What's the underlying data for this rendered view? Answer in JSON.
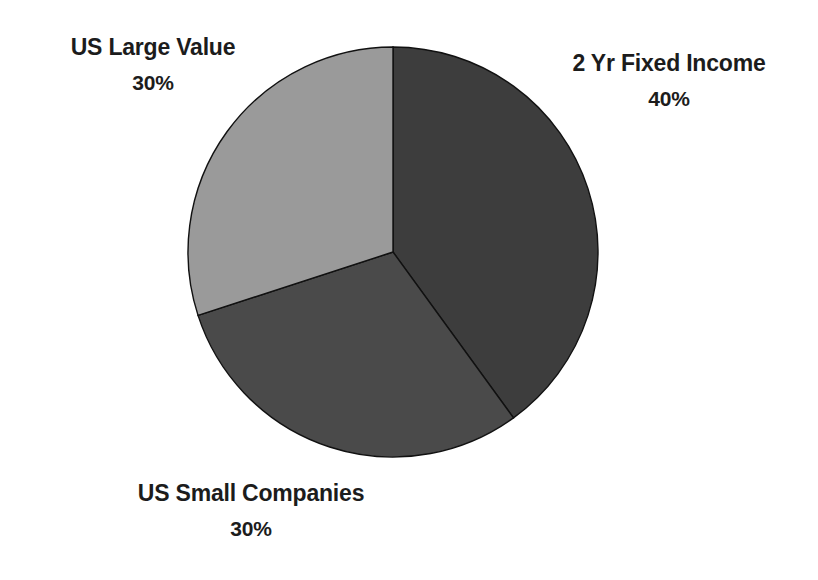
{
  "chart_data": {
    "type": "pie",
    "title": "",
    "subtitle": "",
    "xlabel": "",
    "ylabel": "",
    "legend_position": "none",
    "grid": false,
    "labels_outside": true,
    "start_angle_deg": 0,
    "direction": "clockwise",
    "categories": [
      "2 Yr Fixed Income",
      "US Small Companies",
      "US Large Value"
    ],
    "values": [
      40,
      30,
      30
    ],
    "unit": "%",
    "slices": [
      {
        "name": "2 Yr Fixed Income",
        "value": 40,
        "value_label": "40%",
        "color": "#3d3d3d",
        "start_deg": 0,
        "end_deg": 144,
        "label_position": "upper-right"
      },
      {
        "name": "US Small Companies",
        "value": 30,
        "value_label": "30%",
        "color": "#4a4a4a",
        "start_deg": 144,
        "end_deg": 252,
        "label_position": "bottom-center"
      },
      {
        "name": "US Large Value",
        "value": 30,
        "value_label": "30%",
        "color": "#9a9a9a",
        "start_deg": 252,
        "end_deg": 360,
        "label_position": "upper-left"
      }
    ]
  },
  "callouts": {
    "us_large_value": {
      "name": "US Large Value",
      "value_label": "30%"
    },
    "two_yr_fixed_income": {
      "name": "2 Yr Fixed Income",
      "value_label": "40%"
    },
    "us_small_companies": {
      "name": "US Small Companies",
      "value_label": "30%"
    }
  },
  "colors": {
    "background": "#ffffff",
    "text": "#1c1c1c",
    "slice_outline": "#111111",
    "slice_fixed_income": "#3d3d3d",
    "slice_small_companies": "#4a4a4a",
    "slice_large_value": "#9a9a9a"
  },
  "geometry": {
    "center_x": 393,
    "center_y": 252,
    "radius": 205
  }
}
